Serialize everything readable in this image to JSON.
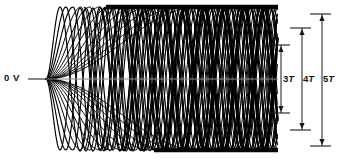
{
  "figure": {
    "type": "eye-diagram",
    "background_color": "#ffffff",
    "trace_color": "#000000",
    "baseline_color": "#6e6e6e"
  },
  "baseline": {
    "label": "0 V",
    "y": 79,
    "x_start": 28,
    "x_end": 278,
    "lead_in_x_end": 46
  },
  "dimensions": [
    {
      "id": "3T",
      "prefix": "3",
      "symbol": "T",
      "label": "3T",
      "x": 281,
      "top": 45,
      "bottom": 113,
      "label_x": 283,
      "label_y": 74
    },
    {
      "id": "4T",
      "prefix": "4",
      "symbol": "T",
      "label": "4T",
      "x": 302,
      "top": 28,
      "bottom": 130,
      "label_x": 303,
      "label_y": 74
    },
    {
      "id": "5T",
      "prefix": "5",
      "symbol": "T",
      "label": "5T",
      "x": 322,
      "top": 14,
      "bottom": 146,
      "label_x": 323,
      "label_y": 74
    }
  ],
  "chart_data": {
    "type": "line",
    "title": "",
    "xlabel": "",
    "ylabel": "",
    "xlim": [
      0,
      344
    ],
    "ylim": [
      0,
      161
    ],
    "grid": false,
    "legend": null,
    "annotations": [
      "0 V",
      "3T",
      "4T",
      "5T"
    ],
    "geometry": {
      "origin_x": 46,
      "origin_y": 79,
      "top_envelope_y": 7,
      "bottom_envelope_y": 150,
      "right_edge_x": 278,
      "amplitude_top": 72,
      "amplitude_bottom": 71,
      "period_px": 40,
      "n_traces": 13
    },
    "series": [
      {
        "name": "pulse-1",
        "start_x": 46,
        "rise_px": 14,
        "phase": 0,
        "polarity": 1
      },
      {
        "name": "pulse-2",
        "start_x": 46,
        "rise_px": 20,
        "phase": 0,
        "polarity": 1
      },
      {
        "name": "pulse-3",
        "start_x": 46,
        "rise_px": 27,
        "phase": 0,
        "polarity": 1
      },
      {
        "name": "pulse-4",
        "start_x": 46,
        "rise_px": 35,
        "phase": 0,
        "polarity": 1
      },
      {
        "name": "pulse-5",
        "start_x": 46,
        "rise_px": 44,
        "phase": 0,
        "polarity": 1
      },
      {
        "name": "pulse-6",
        "start_x": 46,
        "rise_px": 54,
        "phase": 0,
        "polarity": 1
      },
      {
        "name": "pulse-7",
        "start_x": 46,
        "rise_px": 65,
        "phase": 0,
        "polarity": 1
      },
      {
        "name": "pulse-8",
        "start_x": 46,
        "rise_px": 77,
        "phase": 0,
        "polarity": 1
      },
      {
        "name": "pulse-9",
        "start_x": 46,
        "rise_px": 90,
        "phase": 0,
        "polarity": 1
      },
      {
        "name": "pulse-10",
        "start_x": 46,
        "rise_px": 104,
        "phase": 0,
        "polarity": 1
      },
      {
        "name": "pulse-11",
        "start_x": 46,
        "rise_px": 119,
        "phase": 0,
        "polarity": 1
      },
      {
        "name": "pulse-12",
        "start_x": 46,
        "rise_px": 135,
        "phase": 0,
        "polarity": 1
      },
      {
        "name": "pulse-13",
        "start_x": 46,
        "rise_px": 152,
        "phase": 0,
        "polarity": 1
      }
    ]
  }
}
